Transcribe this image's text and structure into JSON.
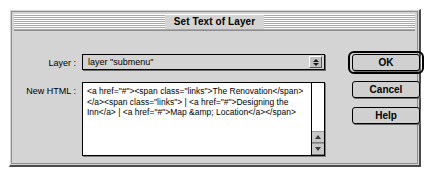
{
  "dialog": {
    "title": "Set Text of Layer"
  },
  "form": {
    "layer_label": "Layer :",
    "layer_value": "layer \"submenu\"",
    "html_label": "New HTML :",
    "html_value": "<a href=\"#\"><span class=\"links\">The Renovation</span></a><span class=\"links\"> | <a href=\"#\">Designing the Inn</a> | <a href=\"#\">Map &amp; Location</a></span>"
  },
  "buttons": {
    "ok": "OK",
    "cancel": "Cancel",
    "help": "Help"
  },
  "icons": {
    "stepper_up": "triangle-up-icon",
    "stepper_down": "triangle-down-icon",
    "scroll_up": "scroll-up-arrow-icon",
    "scroll_down": "scroll-down-arrow-icon"
  },
  "colors": {
    "dialog_bg": "#d4d4d4",
    "field_bg": "#ffffff",
    "border": "#000000",
    "text": "#000000"
  }
}
